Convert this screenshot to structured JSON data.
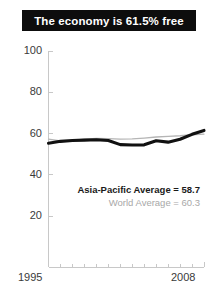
{
  "title": {
    "text": "The economy is 61.5% free"
  },
  "colors": {
    "banner_bg": "#0d0d0d",
    "banner_text": "#ffffff",
    "axis": "#c8c8c8",
    "tick_label": "#3a3a3a",
    "asia_pacific_line": "#111111",
    "world_line": "#b5b5b5",
    "legend_asia_text": "#1a1a1a",
    "legend_world_text": "#a8a8a8"
  },
  "legend": {
    "asia_pacific": "Asia-Pacific Average = 58.7",
    "world": "World Average = 60.3"
  },
  "chart_data": {
    "type": "line",
    "title": "The economy is 61.5% free",
    "xlabel": "",
    "ylabel": "",
    "xlim": [
      1995,
      2008
    ],
    "ylim": [
      0,
      100
    ],
    "yticks": [
      20,
      40,
      60,
      80,
      100
    ],
    "ytick_labels": [
      "20",
      "40",
      "60",
      "80",
      "100"
    ],
    "xticks": [
      1995,
      1996,
      1997,
      1998,
      1999,
      2000,
      2001,
      2002,
      2003,
      2004,
      2005,
      2006,
      2007,
      2008
    ],
    "xtick_labels_shown": [
      "1995",
      "2008"
    ],
    "grid": false,
    "legend_position": "inside-lower-right",
    "x": [
      1995,
      1996,
      1997,
      1998,
      1999,
      2000,
      2001,
      2002,
      2003,
      2004,
      2005,
      2006,
      2007,
      2008
    ],
    "series": [
      {
        "name": "Asia-Pacific Average",
        "color": "#111111",
        "width": "thick",
        "average": 58.7,
        "values": [
          55.3,
          56.2,
          56.6,
          56.8,
          57.0,
          56.6,
          54.6,
          54.4,
          54.5,
          56.5,
          55.8,
          57.2,
          59.6,
          61.5
        ]
      },
      {
        "name": "World Average",
        "color": "#b5b5b5",
        "width": "thin",
        "average": 60.3,
        "values": [
          57.3,
          56.4,
          56.6,
          57.2,
          57.6,
          57.5,
          57.3,
          57.4,
          57.8,
          58.3,
          58.6,
          58.9,
          59.4,
          59.7
        ]
      }
    ]
  }
}
